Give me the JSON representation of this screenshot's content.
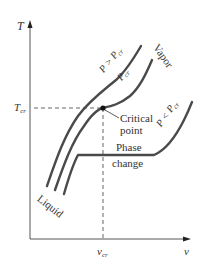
{
  "figure": {
    "type": "T-v diagram",
    "axes": {
      "y_label": "T",
      "x_label": "v"
    },
    "reference_lines": {
      "t_cr": {
        "label": "T",
        "subscript": "cr"
      },
      "v_cr": {
        "label": "v",
        "subscript": "cr"
      }
    },
    "curves": [
      {
        "label": "P > P",
        "subscript": "cr"
      },
      {
        "label": "P",
        "subscript": "cr"
      },
      {
        "label": "P < P",
        "subscript": "cr"
      }
    ],
    "annotations": {
      "critical_point_line1": "Critical",
      "critical_point_line2": "point",
      "phase_change_line1": "Phase",
      "phase_change_line2": "change",
      "vapor": "Vapor",
      "liquid": "Liquid"
    },
    "colors": {
      "curve": "#4a4a4a",
      "axis": "#555555",
      "dashed": "#555555",
      "point": "#111111"
    }
  }
}
